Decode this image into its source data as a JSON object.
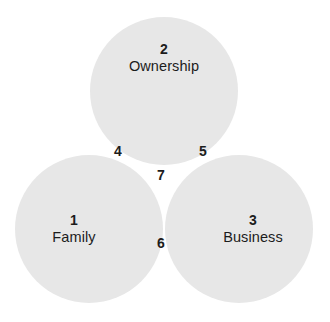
{
  "diagram": {
    "type": "venn",
    "title": "",
    "background_color": "#ffffff",
    "text_color": "#1c1c1c",
    "fill_single": "#e7e7e7",
    "fill_double": "#cdcdcd",
    "fill_triple": "#b4b4b4",
    "sets": [
      {
        "id": "family",
        "number": "1",
        "label": "Family",
        "position": "bottom-left"
      },
      {
        "id": "ownership",
        "number": "2",
        "label": "Ownership",
        "position": "top"
      },
      {
        "id": "business",
        "number": "3",
        "label": "Business",
        "position": "bottom-right"
      }
    ],
    "intersections": [
      {
        "id": "family-ownership",
        "number": "4",
        "label": "",
        "sets": "Family + Ownership"
      },
      {
        "id": "ownership-business",
        "number": "5",
        "label": "",
        "sets": "Ownership + Business"
      },
      {
        "id": "family-business",
        "number": "6",
        "label": "",
        "sets": "Family + Business"
      },
      {
        "id": "family-ownership-business",
        "number": "7",
        "label": "",
        "sets": "Family + Ownership + Business"
      }
    ]
  }
}
